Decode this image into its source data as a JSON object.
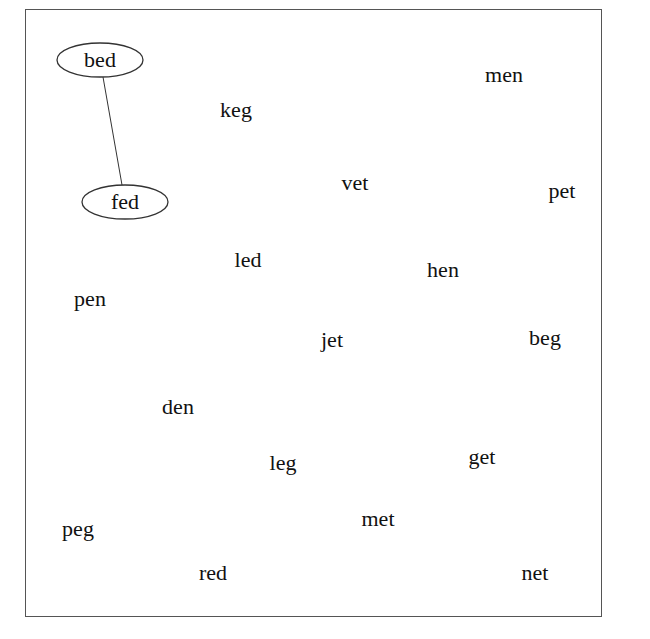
{
  "diagram": {
    "frame_color": "#555555",
    "nodes": [
      {
        "id": "bed",
        "label": "bed",
        "x": 100,
        "y": 60,
        "circled": true
      },
      {
        "id": "fed",
        "label": "fed",
        "x": 125,
        "y": 202,
        "circled": true
      },
      {
        "id": "keg",
        "label": "keg",
        "x": 236,
        "y": 110,
        "circled": false
      },
      {
        "id": "men",
        "label": "men",
        "x": 504,
        "y": 75,
        "circled": false
      },
      {
        "id": "vet",
        "label": "vet",
        "x": 355,
        "y": 183,
        "circled": false
      },
      {
        "id": "pet",
        "label": "pet",
        "x": 562,
        "y": 191,
        "circled": false
      },
      {
        "id": "led",
        "label": "led",
        "x": 248,
        "y": 260,
        "circled": false
      },
      {
        "id": "hen",
        "label": "hen",
        "x": 443,
        "y": 270,
        "circled": false
      },
      {
        "id": "pen",
        "label": "pen",
        "x": 90,
        "y": 299,
        "circled": false
      },
      {
        "id": "jet",
        "label": "jet",
        "x": 332,
        "y": 340,
        "circled": false
      },
      {
        "id": "beg",
        "label": "beg",
        "x": 545,
        "y": 338,
        "circled": false
      },
      {
        "id": "den",
        "label": "den",
        "x": 178,
        "y": 407,
        "circled": false
      },
      {
        "id": "leg",
        "label": "leg",
        "x": 283,
        "y": 463,
        "circled": false
      },
      {
        "id": "get",
        "label": "get",
        "x": 482,
        "y": 457,
        "circled": false
      },
      {
        "id": "peg",
        "label": "peg",
        "x": 78,
        "y": 529,
        "circled": false
      },
      {
        "id": "met",
        "label": "met",
        "x": 378,
        "y": 519,
        "circled": false
      },
      {
        "id": "red",
        "label": "red",
        "x": 213,
        "y": 573,
        "circled": false
      },
      {
        "id": "net",
        "label": "net",
        "x": 535,
        "y": 573,
        "circled": false
      }
    ],
    "edges": [
      {
        "from": "bed",
        "to": "fed",
        "x1": 103,
        "y1": 77,
        "x2": 122,
        "y2": 185
      }
    ]
  }
}
